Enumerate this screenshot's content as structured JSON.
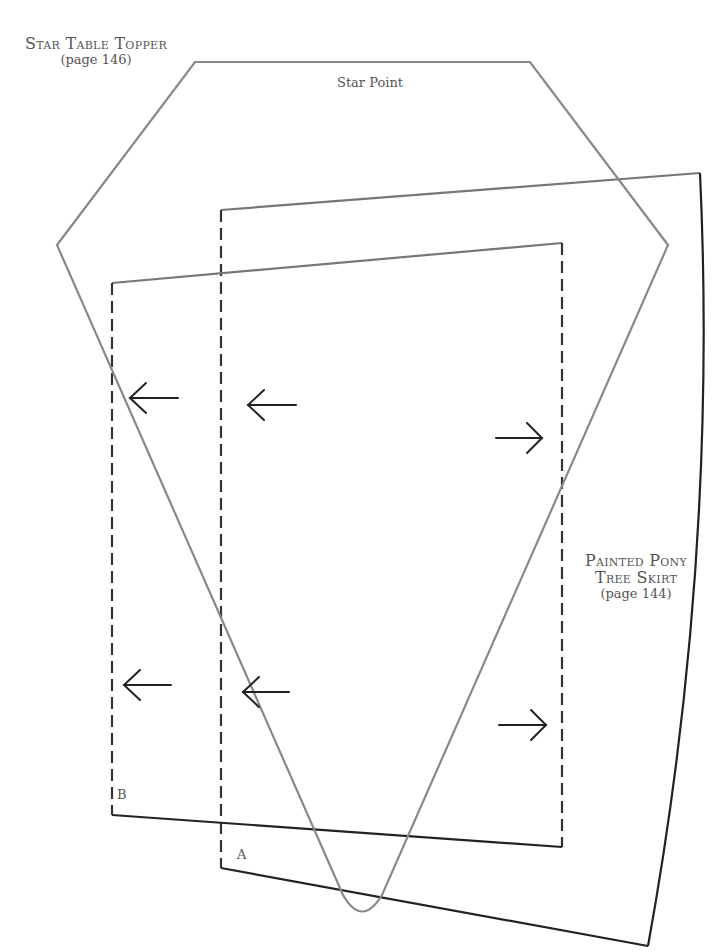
{
  "title_block": {
    "project": "Star Table Topper",
    "page_ref": "(page 146)"
  },
  "star_point": {
    "label": "Star Point",
    "stroke_color": "#888888"
  },
  "skirt_block": {
    "project_line1": "Painted Pony",
    "project_line2": "Tree Skirt",
    "page_ref": "(page 144)",
    "stroke_color": "#222222"
  },
  "pieces": {
    "a_label": "A",
    "b_label": "B"
  },
  "arrows": [
    {
      "direction": "left",
      "x1": 130,
      "x2": 178,
      "y": 398
    },
    {
      "direction": "left",
      "x1": 248,
      "x2": 296,
      "y": 405
    },
    {
      "direction": "right",
      "x1": 496,
      "x2": 542,
      "y": 438
    },
    {
      "direction": "left",
      "x1": 124,
      "x2": 171,
      "y": 685
    },
    {
      "direction": "left",
      "x1": 243,
      "x2": 289,
      "y": 692
    },
    {
      "direction": "right",
      "x1": 499,
      "x2": 546,
      "y": 725
    }
  ]
}
